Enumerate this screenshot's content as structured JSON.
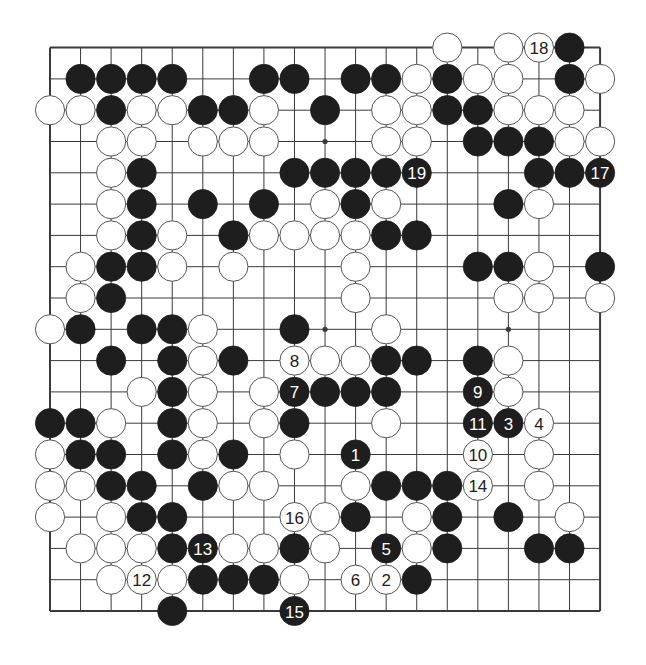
{
  "board": {
    "size": 19,
    "origin": {
      "x": 50,
      "y": 47.6
    },
    "spacing": {
      "x": 30.56,
      "y": 31.3
    },
    "stone_radius": 14.6,
    "colors": {
      "line": "#3a3a3a",
      "black": "#1e1e1e",
      "white": "#ffffff",
      "white_edge": "#555555",
      "background": "#ffffff"
    },
    "star_points": [
      [
        9,
        3
      ],
      [
        9,
        9
      ],
      [
        15,
        9
      ],
      [
        3,
        3
      ],
      [
        15,
        3
      ],
      [
        3,
        9
      ],
      [
        3,
        15
      ],
      [
        9,
        15
      ],
      [
        15,
        15
      ]
    ],
    "stones": [
      {
        "c": 13,
        "r": 0,
        "color": "W"
      },
      {
        "c": 15,
        "r": 0,
        "color": "W"
      },
      {
        "c": 16,
        "r": 0,
        "color": "W",
        "label": "18"
      },
      {
        "c": 17,
        "r": 0,
        "color": "B"
      },
      {
        "c": 1,
        "r": 1,
        "color": "B"
      },
      {
        "c": 2,
        "r": 1,
        "color": "B"
      },
      {
        "c": 3,
        "r": 1,
        "color": "B"
      },
      {
        "c": 4,
        "r": 1,
        "color": "B"
      },
      {
        "c": 7,
        "r": 1,
        "color": "B"
      },
      {
        "c": 8,
        "r": 1,
        "color": "B"
      },
      {
        "c": 10,
        "r": 1,
        "color": "B"
      },
      {
        "c": 11,
        "r": 1,
        "color": "B"
      },
      {
        "c": 12,
        "r": 1,
        "color": "W"
      },
      {
        "c": 13,
        "r": 1,
        "color": "B"
      },
      {
        "c": 14,
        "r": 1,
        "color": "W"
      },
      {
        "c": 15,
        "r": 1,
        "color": "W"
      },
      {
        "c": 17,
        "r": 1,
        "color": "B"
      },
      {
        "c": 18,
        "r": 1,
        "color": "W"
      },
      {
        "c": 0,
        "r": 2,
        "color": "W"
      },
      {
        "c": 1,
        "r": 2,
        "color": "W"
      },
      {
        "c": 2,
        "r": 2,
        "color": "B"
      },
      {
        "c": 3,
        "r": 2,
        "color": "W"
      },
      {
        "c": 4,
        "r": 2,
        "color": "W"
      },
      {
        "c": 5,
        "r": 2,
        "color": "B"
      },
      {
        "c": 6,
        "r": 2,
        "color": "B"
      },
      {
        "c": 7,
        "r": 2,
        "color": "W"
      },
      {
        "c": 9,
        "r": 2,
        "color": "B"
      },
      {
        "c": 11,
        "r": 2,
        "color": "W"
      },
      {
        "c": 12,
        "r": 2,
        "color": "W"
      },
      {
        "c": 13,
        "r": 2,
        "color": "B"
      },
      {
        "c": 14,
        "r": 2,
        "color": "B"
      },
      {
        "c": 15,
        "r": 2,
        "color": "W"
      },
      {
        "c": 16,
        "r": 2,
        "color": "W"
      },
      {
        "c": 17,
        "r": 2,
        "color": "W"
      },
      {
        "c": 2,
        "r": 3,
        "color": "W"
      },
      {
        "c": 3,
        "r": 3,
        "color": "W"
      },
      {
        "c": 5,
        "r": 3,
        "color": "W"
      },
      {
        "c": 6,
        "r": 3,
        "color": "W"
      },
      {
        "c": 7,
        "r": 3,
        "color": "W"
      },
      {
        "c": 11,
        "r": 3,
        "color": "W"
      },
      {
        "c": 12,
        "r": 3,
        "color": "W"
      },
      {
        "c": 14,
        "r": 3,
        "color": "B"
      },
      {
        "c": 15,
        "r": 3,
        "color": "B"
      },
      {
        "c": 16,
        "r": 3,
        "color": "B"
      },
      {
        "c": 17,
        "r": 3,
        "color": "W"
      },
      {
        "c": 18,
        "r": 3,
        "color": "W"
      },
      {
        "c": 2,
        "r": 4,
        "color": "W"
      },
      {
        "c": 3,
        "r": 4,
        "color": "B"
      },
      {
        "c": 8,
        "r": 4,
        "color": "B"
      },
      {
        "c": 9,
        "r": 4,
        "color": "B"
      },
      {
        "c": 10,
        "r": 4,
        "color": "B"
      },
      {
        "c": 11,
        "r": 4,
        "color": "B"
      },
      {
        "c": 12,
        "r": 4,
        "color": "B",
        "label": "19"
      },
      {
        "c": 16,
        "r": 4,
        "color": "B"
      },
      {
        "c": 17,
        "r": 4,
        "color": "B"
      },
      {
        "c": 18,
        "r": 4,
        "color": "B",
        "label": "17"
      },
      {
        "c": 2,
        "r": 5,
        "color": "W"
      },
      {
        "c": 3,
        "r": 5,
        "color": "B"
      },
      {
        "c": 5,
        "r": 5,
        "color": "B"
      },
      {
        "c": 7,
        "r": 5,
        "color": "B"
      },
      {
        "c": 9,
        "r": 5,
        "color": "W"
      },
      {
        "c": 10,
        "r": 5,
        "color": "B"
      },
      {
        "c": 11,
        "r": 5,
        "color": "W"
      },
      {
        "c": 15,
        "r": 5,
        "color": "B"
      },
      {
        "c": 16,
        "r": 5,
        "color": "W"
      },
      {
        "c": 2,
        "r": 6,
        "color": "W"
      },
      {
        "c": 3,
        "r": 6,
        "color": "B"
      },
      {
        "c": 4,
        "r": 6,
        "color": "W"
      },
      {
        "c": 6,
        "r": 6,
        "color": "B"
      },
      {
        "c": 7,
        "r": 6,
        "color": "W"
      },
      {
        "c": 8,
        "r": 6,
        "color": "W"
      },
      {
        "c": 9,
        "r": 6,
        "color": "W"
      },
      {
        "c": 10,
        "r": 6,
        "color": "W"
      },
      {
        "c": 11,
        "r": 6,
        "color": "B"
      },
      {
        "c": 12,
        "r": 6,
        "color": "B"
      },
      {
        "c": 1,
        "r": 7,
        "color": "W"
      },
      {
        "c": 2,
        "r": 7,
        "color": "B"
      },
      {
        "c": 3,
        "r": 7,
        "color": "B"
      },
      {
        "c": 4,
        "r": 7,
        "color": "W"
      },
      {
        "c": 6,
        "r": 7,
        "color": "W"
      },
      {
        "c": 10,
        "r": 7,
        "color": "W"
      },
      {
        "c": 14,
        "r": 7,
        "color": "B"
      },
      {
        "c": 15,
        "r": 7,
        "color": "B"
      },
      {
        "c": 16,
        "r": 7,
        "color": "W"
      },
      {
        "c": 18,
        "r": 7,
        "color": "B"
      },
      {
        "c": 1,
        "r": 8,
        "color": "W"
      },
      {
        "c": 2,
        "r": 8,
        "color": "B"
      },
      {
        "c": 10,
        "r": 8,
        "color": "W"
      },
      {
        "c": 15,
        "r": 8,
        "color": "W"
      },
      {
        "c": 16,
        "r": 8,
        "color": "W"
      },
      {
        "c": 18,
        "r": 8,
        "color": "W"
      },
      {
        "c": 0,
        "r": 9,
        "color": "W"
      },
      {
        "c": 1,
        "r": 9,
        "color": "B"
      },
      {
        "c": 3,
        "r": 9,
        "color": "B"
      },
      {
        "c": 4,
        "r": 9,
        "color": "B"
      },
      {
        "c": 5,
        "r": 9,
        "color": "W"
      },
      {
        "c": 8,
        "r": 9,
        "color": "B"
      },
      {
        "c": 11,
        "r": 9,
        "color": "W"
      },
      {
        "c": 2,
        "r": 10,
        "color": "B"
      },
      {
        "c": 4,
        "r": 10,
        "color": "B"
      },
      {
        "c": 5,
        "r": 10,
        "color": "W"
      },
      {
        "c": 6,
        "r": 10,
        "color": "B"
      },
      {
        "c": 8,
        "r": 10,
        "color": "W",
        "label": "8"
      },
      {
        "c": 9,
        "r": 10,
        "color": "W"
      },
      {
        "c": 10,
        "r": 10,
        "color": "W"
      },
      {
        "c": 11,
        "r": 10,
        "color": "B"
      },
      {
        "c": 12,
        "r": 10,
        "color": "B"
      },
      {
        "c": 14,
        "r": 10,
        "color": "B"
      },
      {
        "c": 15,
        "r": 10,
        "color": "W"
      },
      {
        "c": 3,
        "r": 11,
        "color": "W"
      },
      {
        "c": 4,
        "r": 11,
        "color": "B"
      },
      {
        "c": 5,
        "r": 11,
        "color": "W"
      },
      {
        "c": 7,
        "r": 11,
        "color": "W"
      },
      {
        "c": 8,
        "r": 11,
        "color": "B",
        "label": "7"
      },
      {
        "c": 9,
        "r": 11,
        "color": "B"
      },
      {
        "c": 10,
        "r": 11,
        "color": "B"
      },
      {
        "c": 11,
        "r": 11,
        "color": "B"
      },
      {
        "c": 14,
        "r": 11,
        "color": "B",
        "label": "9"
      },
      {
        "c": 15,
        "r": 11,
        "color": "W"
      },
      {
        "c": 0,
        "r": 12,
        "color": "B"
      },
      {
        "c": 1,
        "r": 12,
        "color": "B"
      },
      {
        "c": 2,
        "r": 12,
        "color": "W"
      },
      {
        "c": 4,
        "r": 12,
        "color": "B"
      },
      {
        "c": 5,
        "r": 12,
        "color": "W"
      },
      {
        "c": 7,
        "r": 12,
        "color": "W"
      },
      {
        "c": 8,
        "r": 12,
        "color": "B"
      },
      {
        "c": 11,
        "r": 12,
        "color": "W"
      },
      {
        "c": 14,
        "r": 12,
        "color": "B",
        "label": "11"
      },
      {
        "c": 15,
        "r": 12,
        "color": "B",
        "label": "3"
      },
      {
        "c": 16,
        "r": 12,
        "color": "W",
        "label": "4"
      },
      {
        "c": 0,
        "r": 13,
        "color": "W"
      },
      {
        "c": 1,
        "r": 13,
        "color": "B"
      },
      {
        "c": 2,
        "r": 13,
        "color": "B"
      },
      {
        "c": 4,
        "r": 13,
        "color": "B"
      },
      {
        "c": 5,
        "r": 13,
        "color": "W"
      },
      {
        "c": 6,
        "r": 13,
        "color": "B"
      },
      {
        "c": 8,
        "r": 13,
        "color": "W"
      },
      {
        "c": 10,
        "r": 13,
        "color": "B",
        "label": "1"
      },
      {
        "c": 14,
        "r": 13,
        "color": "W",
        "label": "10"
      },
      {
        "c": 16,
        "r": 13,
        "color": "W"
      },
      {
        "c": 0,
        "r": 14,
        "color": "W"
      },
      {
        "c": 1,
        "r": 14,
        "color": "W"
      },
      {
        "c": 2,
        "r": 14,
        "color": "B"
      },
      {
        "c": 3,
        "r": 14,
        "color": "B"
      },
      {
        "c": 5,
        "r": 14,
        "color": "B"
      },
      {
        "c": 6,
        "r": 14,
        "color": "W"
      },
      {
        "c": 7,
        "r": 14,
        "color": "W"
      },
      {
        "c": 10,
        "r": 14,
        "color": "W"
      },
      {
        "c": 11,
        "r": 14,
        "color": "B"
      },
      {
        "c": 12,
        "r": 14,
        "color": "B"
      },
      {
        "c": 13,
        "r": 14,
        "color": "B"
      },
      {
        "c": 14,
        "r": 14,
        "color": "W",
        "label": "14"
      },
      {
        "c": 16,
        "r": 14,
        "color": "W"
      },
      {
        "c": 0,
        "r": 15,
        "color": "W"
      },
      {
        "c": 2,
        "r": 15,
        "color": "W"
      },
      {
        "c": 3,
        "r": 15,
        "color": "B"
      },
      {
        "c": 4,
        "r": 15,
        "color": "B"
      },
      {
        "c": 8,
        "r": 15,
        "color": "W",
        "label": "16"
      },
      {
        "c": 9,
        "r": 15,
        "color": "W"
      },
      {
        "c": 10,
        "r": 15,
        "color": "B"
      },
      {
        "c": 12,
        "r": 15,
        "color": "W"
      },
      {
        "c": 13,
        "r": 15,
        "color": "B"
      },
      {
        "c": 15,
        "r": 15,
        "color": "B"
      },
      {
        "c": 17,
        "r": 15,
        "color": "W"
      },
      {
        "c": 1,
        "r": 16,
        "color": "W"
      },
      {
        "c": 2,
        "r": 16,
        "color": "W"
      },
      {
        "c": 3,
        "r": 16,
        "color": "W"
      },
      {
        "c": 4,
        "r": 16,
        "color": "B"
      },
      {
        "c": 5,
        "r": 16,
        "color": "B",
        "label": "13"
      },
      {
        "c": 6,
        "r": 16,
        "color": "W"
      },
      {
        "c": 7,
        "r": 16,
        "color": "W"
      },
      {
        "c": 8,
        "r": 16,
        "color": "B"
      },
      {
        "c": 9,
        "r": 16,
        "color": "W"
      },
      {
        "c": 11,
        "r": 16,
        "color": "B",
        "label": "5"
      },
      {
        "c": 12,
        "r": 16,
        "color": "W"
      },
      {
        "c": 13,
        "r": 16,
        "color": "B"
      },
      {
        "c": 16,
        "r": 16,
        "color": "B"
      },
      {
        "c": 17,
        "r": 16,
        "color": "B"
      },
      {
        "c": 2,
        "r": 17,
        "color": "W"
      },
      {
        "c": 3,
        "r": 17,
        "color": "W",
        "label": "12"
      },
      {
        "c": 4,
        "r": 17,
        "color": "W"
      },
      {
        "c": 5,
        "r": 17,
        "color": "B"
      },
      {
        "c": 6,
        "r": 17,
        "color": "B"
      },
      {
        "c": 7,
        "r": 17,
        "color": "B"
      },
      {
        "c": 8,
        "r": 17,
        "color": "W"
      },
      {
        "c": 10,
        "r": 17,
        "color": "W",
        "label": "6"
      },
      {
        "c": 11,
        "r": 17,
        "color": "W",
        "label": "2"
      },
      {
        "c": 12,
        "r": 17,
        "color": "B"
      },
      {
        "c": 4,
        "r": 18,
        "color": "B"
      },
      {
        "c": 8,
        "r": 18,
        "color": "B",
        "label": "15"
      }
    ]
  }
}
